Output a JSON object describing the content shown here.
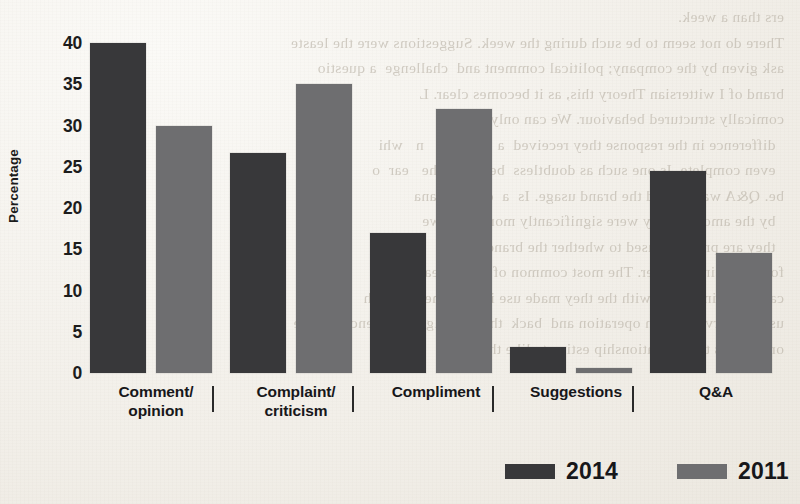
{
  "page": {
    "background_color": "#f4f2ee",
    "bleed_through_text": "ers than a week.\nThere do not seem to be such during the week. Suggestions were the leaste\nask given by the company; political comment and  challenge  a questio\nbrand of I wittersian Theory this, as it becomes clear. L\ncomically structured behaviour. We can only (S) 6\n  difference in the response they received  a  one  ina   n   whi\n  even complete. Is one such as doubtless  between  the   ear  o\nbe. Q&A was around the brand usage. Is  a  content  ana\n  by the amounts they were significantly more than  we\n  they are probably used to whether the brand ada\nfollow-up in a greater. The most common of which rea\ncampaign in a type. with the they made use in  volumes  that  th\nusing a service  is  in operation and  back  then  a  slight  influence  in  the \nor of cross these relationship estimate like the fairly    emai"
  },
  "chart_data": {
    "type": "bar",
    "title": "",
    "xlabel": "",
    "ylabel": "Percentage",
    "ylim": [
      0,
      40
    ],
    "yticks": [
      0,
      5,
      10,
      15,
      20,
      25,
      30,
      35,
      40
    ],
    "ytick_labels": [
      "0",
      "5",
      "10",
      "15",
      "20",
      "25",
      "30",
      "35",
      "40"
    ],
    "grid": false,
    "legend_position": "bottom",
    "categories": [
      "Comment/ opinion",
      "Complaint/ criticism",
      "Compliment",
      "Suggestions",
      "Q&A"
    ],
    "category_label_lines": [
      [
        "Comment/",
        "opinion"
      ],
      [
        "Complaint/",
        "criticism"
      ],
      [
        "Compliment"
      ],
      [
        "Suggestions"
      ],
      [
        "Q&A"
      ]
    ],
    "series": [
      {
        "name": "2014",
        "color": "#38383a",
        "values": [
          40,
          26.7,
          17,
          3.2,
          24.5
        ]
      },
      {
        "name": "2011",
        "color": "#6e6e70",
        "values": [
          30,
          35,
          32,
          0.6,
          14.5
        ]
      }
    ]
  },
  "legend": {
    "items": [
      {
        "label": "2014",
        "color": "#38383a"
      },
      {
        "label": "2011",
        "color": "#6e6e70"
      }
    ]
  }
}
